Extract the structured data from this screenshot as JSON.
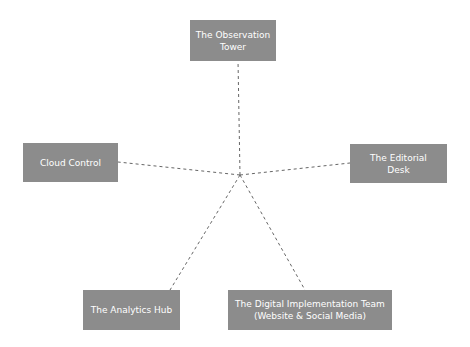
{
  "diagram": {
    "type": "hub-and-spoke",
    "connector_style": "dashed",
    "colors": {
      "node_fill": "#8c8c8c",
      "node_text": "#ffffff",
      "connector": "#666666"
    },
    "nodes": [
      {
        "id": "observation",
        "label": "The Observation\nTower"
      },
      {
        "id": "cloud",
        "label": "Cloud Control"
      },
      {
        "id": "editorial",
        "label": "The Editorial\nDesk"
      },
      {
        "id": "analytics",
        "label": "The Analytics Hub"
      },
      {
        "id": "digital",
        "label": "The Digital Implementation Team\n(Website & Social Media)"
      }
    ],
    "edges": [
      {
        "from": "center",
        "to": "observation"
      },
      {
        "from": "center",
        "to": "cloud"
      },
      {
        "from": "center",
        "to": "editorial"
      },
      {
        "from": "center",
        "to": "analytics"
      },
      {
        "from": "center",
        "to": "digital"
      }
    ]
  }
}
